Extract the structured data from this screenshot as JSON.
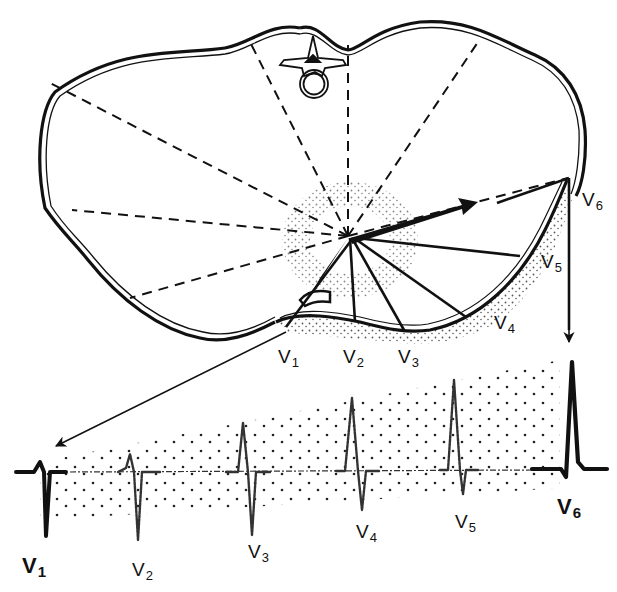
{
  "figure": {
    "colors": {
      "ink": "#111111",
      "background": "#ffffff",
      "stipple": "#222222"
    }
  },
  "chest": {
    "electrode_labels": [
      {
        "id": "V1",
        "base": "V",
        "sub": "1",
        "x": 283,
        "y": 350
      },
      {
        "id": "V2",
        "base": "V",
        "sub": "2",
        "x": 346,
        "y": 350
      },
      {
        "id": "V3",
        "base": "V",
        "sub": "3",
        "x": 399,
        "y": 350
      },
      {
        "id": "V4",
        "base": "V",
        "sub": "4",
        "x": 492,
        "y": 315
      },
      {
        "id": "V5",
        "base": "V",
        "sub": "5",
        "x": 540,
        "y": 254
      },
      {
        "id": "V6",
        "base": "V",
        "sub": "6",
        "x": 581,
        "y": 193
      }
    ]
  },
  "ecg": {
    "baseline_y": 472,
    "complexes": [
      {
        "id": "V1",
        "base": "V",
        "sub": "1",
        "label_x": 22,
        "label_y": 560,
        "bold": true,
        "x": 42,
        "r": 14,
        "s": 64,
        "style": "bold"
      },
      {
        "id": "V2",
        "base": "V",
        "sub": "2",
        "label_x": 132,
        "label_y": 563,
        "bold": false,
        "x": 131,
        "r": 20,
        "s": 64,
        "style": "faint"
      },
      {
        "id": "V3",
        "base": "V",
        "sub": "3",
        "label_x": 248,
        "label_y": 545,
        "bold": false,
        "x": 243,
        "r": 52,
        "s": 58,
        "style": "faint"
      },
      {
        "id": "V4",
        "base": "V",
        "sub": "4",
        "label_x": 356,
        "label_y": 525,
        "bold": false,
        "x": 353,
        "r": 77,
        "s": 48,
        "style": "faint"
      },
      {
        "id": "V5",
        "base": "V",
        "sub": "5",
        "label_x": 453,
        "label_y": 516,
        "bold": false,
        "x": 455,
        "r": 88,
        "s": 26,
        "style": "faint"
      },
      {
        "id": "V6",
        "base": "V",
        "sub": "6",
        "label_x": 558,
        "label_y": 502,
        "bold": true,
        "x": 571,
        "r": 112,
        "s": 8,
        "style": "bold"
      }
    ]
  }
}
